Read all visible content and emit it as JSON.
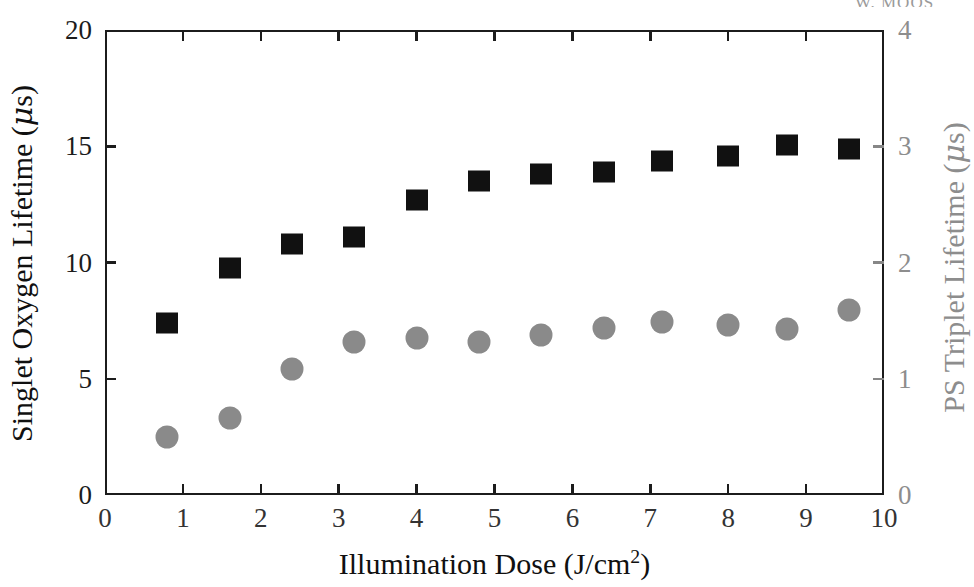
{
  "running_header": {
    "text": "W. MOOS"
  },
  "axes": {
    "left": {
      "title_prefix": "Singlet Oxygen Lifetime (",
      "title_mu": "μ",
      "title_suffix": "s)",
      "ticks": [
        "0",
        "5",
        "10",
        "15",
        "20"
      ],
      "color": "#101010"
    },
    "right": {
      "title_prefix": "PS Triplet Lifetime (",
      "title_mu": "μ",
      "title_suffix": "s)",
      "ticks": [
        "0",
        "1",
        "2",
        "3",
        "4"
      ],
      "color": "#8d8d8d"
    },
    "bottom": {
      "title_prefix": "Illumination Dose (J/cm",
      "title_sup": "2",
      "title_suffix": ")",
      "ticks": [
        "0",
        "1",
        "2",
        "3",
        "4",
        "5",
        "6",
        "7",
        "8",
        "9",
        "10"
      ],
      "color": "#101010"
    }
  },
  "chart_data": {
    "type": "scatter",
    "title": "",
    "xlabel": "Illumination Dose (J/cm2)",
    "ylabel": "Singlet Oxygen Lifetime (μs)",
    "y2label": "PS Triplet Lifetime (μs)",
    "xlim": [
      0,
      10
    ],
    "ylim": [
      0,
      20
    ],
    "y2lim": [
      0,
      4
    ],
    "xticks": [
      0,
      1,
      2,
      3,
      4,
      5,
      6,
      7,
      8,
      9,
      10
    ],
    "yticks": [
      0,
      5,
      10,
      15,
      20
    ],
    "y2ticks": [
      0,
      1,
      2,
      3,
      4
    ],
    "grid": false,
    "legend": "none",
    "series": [
      {
        "name": "Singlet Oxygen Lifetime",
        "marker": "square",
        "color": "#111111",
        "axis": "left",
        "x": [
          0.8,
          1.6,
          2.4,
          3.2,
          4.0,
          4.8,
          5.6,
          6.4,
          7.15,
          8.0,
          8.75,
          9.55
        ],
        "y": [
          7.4,
          9.75,
          10.8,
          11.1,
          12.7,
          13.5,
          13.8,
          13.9,
          14.35,
          14.6,
          15.05,
          14.9
        ]
      },
      {
        "name": "PS Triplet Lifetime",
        "marker": "circle",
        "color": "#8a8a8a",
        "axis": "right",
        "x": [
          0.8,
          1.6,
          2.4,
          3.2,
          4.0,
          4.8,
          5.6,
          6.4,
          7.15,
          8.0,
          8.75,
          9.55
        ],
        "y2": [
          0.5,
          0.66,
          1.08,
          1.32,
          1.35,
          1.32,
          1.38,
          1.44,
          1.49,
          1.46,
          1.43,
          1.59
        ],
        "y_left_equivalent": [
          2.5,
          3.3,
          5.4,
          6.6,
          6.75,
          6.6,
          6.9,
          7.2,
          7.45,
          7.3,
          7.15,
          7.95
        ]
      }
    ]
  }
}
